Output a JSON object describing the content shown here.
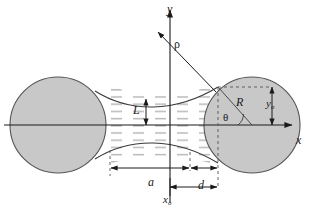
{
  "figure": {
    "colors": {
      "sphere_fill": "#c8c8c8",
      "sphere_stroke": "#4d4d4d",
      "liquid_hatch": "#b4b4b4",
      "axis": "#1a1a1a",
      "dimension": "#1a1a1a",
      "dashed": "#4d4d4d",
      "background": "#ffffff"
    },
    "axes": {
      "y_label": "y",
      "x_label": "x"
    },
    "labels": {
      "rho": "ρ",
      "neck_half_height": "L",
      "sphere_radius": "R",
      "contact_angle": "θ",
      "contact_height": "y",
      "contact_height_sub": "o",
      "half_gap": "a",
      "embrace_depth": "d",
      "contact_abscissa": "x",
      "contact_abscissa_sub": "o"
    }
  }
}
